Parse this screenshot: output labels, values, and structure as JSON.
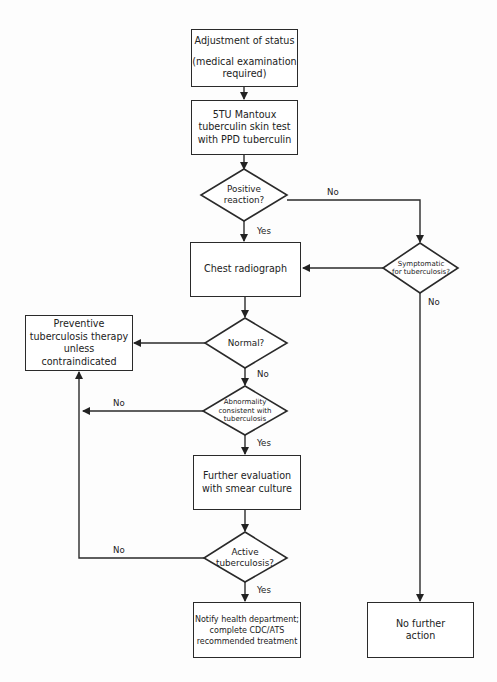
{
  "diagram": {
    "type": "flowchart",
    "nodes": {
      "adjustment": {
        "line1": "Adjustment of status",
        "line2": "(medical examination",
        "line3": "required)"
      },
      "mantoux": {
        "line1": "5TU Mantoux",
        "line2": "tuberculin skin test",
        "line3": "with PPD tuberculin"
      },
      "positive": {
        "line1": "Positive",
        "line2": "reaction?"
      },
      "symptomatic": {
        "line1": "Symptomatic",
        "line2": "for tuberculosis?"
      },
      "chest": {
        "line1": "Chest radiograph"
      },
      "normal": {
        "line1": "Normal?"
      },
      "preventive": {
        "line1": "Preventive",
        "line2": "tuberculosis therapy",
        "line3": "unless contraindicated"
      },
      "abnormality": {
        "line1": "Abnormality",
        "line2": "consistent with",
        "line3": "tuberculosis"
      },
      "further": {
        "line1": "Further evaluation",
        "line2": "with smear culture"
      },
      "active": {
        "line1": "Active",
        "line2": "tuberculosis?"
      },
      "notify": {
        "line1": "Notify health department;",
        "line2": "complete CDC/ATS",
        "line3": "recommended treatment"
      },
      "nofurther": {
        "line1": "No further",
        "line2": "action"
      }
    },
    "edge_labels": {
      "positive_no": "No",
      "positive_yes": "Yes",
      "symptomatic_no": "No",
      "normal_no": "No",
      "abnormality_no": "No",
      "abnormality_yes": "Yes",
      "active_no": "No",
      "active_yes": "Yes"
    },
    "edges": [
      {
        "from": "adjustment",
        "to": "mantoux"
      },
      {
        "from": "mantoux",
        "to": "positive"
      },
      {
        "from": "positive",
        "to": "chest",
        "label": "Yes"
      },
      {
        "from": "positive",
        "to": "symptomatic",
        "label": "No"
      },
      {
        "from": "symptomatic",
        "to": "chest"
      },
      {
        "from": "symptomatic",
        "to": "nofurther",
        "label": "No"
      },
      {
        "from": "chest",
        "to": "normal"
      },
      {
        "from": "normal",
        "to": "preventive"
      },
      {
        "from": "normal",
        "to": "abnormality",
        "label": "No"
      },
      {
        "from": "abnormality",
        "to": "preventive",
        "label": "No"
      },
      {
        "from": "abnormality",
        "to": "further",
        "label": "Yes"
      },
      {
        "from": "further",
        "to": "active"
      },
      {
        "from": "active",
        "to": "preventive",
        "label": "No"
      },
      {
        "from": "active",
        "to": "notify",
        "label": "Yes"
      }
    ]
  }
}
